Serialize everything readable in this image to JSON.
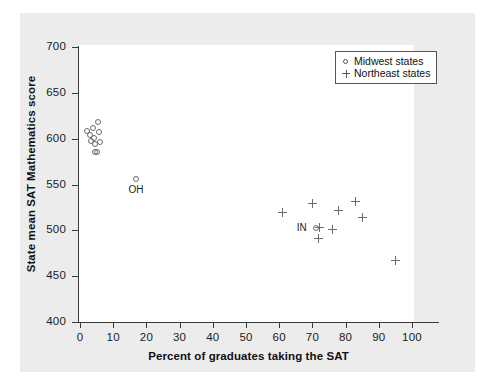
{
  "chart_data": {
    "type": "scatter",
    "title": "",
    "xlabel": "Percent of graduates taking the SAT",
    "ylabel": "State mean SAT Mathematics score",
    "xlim": [
      0,
      100
    ],
    "ylim": [
      400,
      700
    ],
    "xticks": [
      0,
      10,
      20,
      30,
      40,
      50,
      60,
      70,
      80,
      90,
      100
    ],
    "yticks": [
      400,
      450,
      500,
      550,
      600,
      650,
      700
    ],
    "grid": false,
    "legend_position": "top-right",
    "legend": [
      {
        "label": "Midwest states",
        "marker": "circle",
        "key": "midwest"
      },
      {
        "label": "Northeast states",
        "marker": "plus",
        "key": "northeast"
      }
    ],
    "series": [
      {
        "name": "Midwest states",
        "marker": "circle",
        "color": "#6b6b6b",
        "points": [
          {
            "x": 2.0,
            "y": 608
          },
          {
            "x": 3.0,
            "y": 604
          },
          {
            "x": 3.2,
            "y": 598
          },
          {
            "x": 4.0,
            "y": 612
          },
          {
            "x": 4.2,
            "y": 601
          },
          {
            "x": 4.4,
            "y": 594
          },
          {
            "x": 4.6,
            "y": 586
          },
          {
            "x": 5.0,
            "y": 585
          },
          {
            "x": 5.4,
            "y": 618
          },
          {
            "x": 5.6,
            "y": 607
          },
          {
            "x": 6.0,
            "y": 596
          },
          {
            "x": 17.0,
            "y": 556,
            "label": "OH"
          },
          {
            "x": 71.0,
            "y": 503,
            "label": "IN"
          }
        ]
      },
      {
        "name": "Northeast states",
        "marker": "plus",
        "color": "#6b6b6b",
        "points": [
          {
            "x": 61.0,
            "y": 520
          },
          {
            "x": 70.0,
            "y": 529
          },
          {
            "x": 71.8,
            "y": 491
          },
          {
            "x": 72.0,
            "y": 503
          },
          {
            "x": 76.0,
            "y": 501
          },
          {
            "x": 78.0,
            "y": 522
          },
          {
            "x": 83.0,
            "y": 531
          },
          {
            "x": 85.0,
            "y": 514
          },
          {
            "x": 95.0,
            "y": 467
          }
        ]
      }
    ],
    "annotations": [
      {
        "text": "OH",
        "x": 17.0,
        "y": 556
      },
      {
        "text": "IN",
        "x": 71.0,
        "y": 503
      }
    ]
  },
  "colors": {
    "panel_background": "#ececec",
    "plot_background": "#ffffff",
    "axis": "#3a3a3a",
    "marker": "#6b6b6b",
    "text": "#111111",
    "legend_border": "#555555"
  }
}
